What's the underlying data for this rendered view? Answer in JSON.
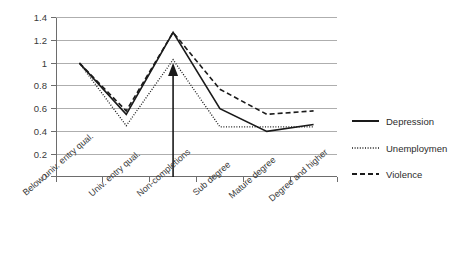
{
  "chart_data": {
    "type": "line",
    "title": "",
    "subtitle": "",
    "xlabel": "",
    "ylabel": "",
    "categories": [
      "Below univ. entry qual.",
      "Univ. entry qual.",
      "Non-completions",
      "Sub degree",
      "Mature degree",
      "Degree and higher"
    ],
    "series": [
      {
        "name": "Depression",
        "style": "solid",
        "color": "#1a1a1a",
        "values": [
          1.0,
          0.55,
          1.27,
          0.6,
          0.4,
          0.46
        ]
      },
      {
        "name": "Unemploymen",
        "style": "dotted",
        "color": "#1a1a1a",
        "values": [
          1.0,
          0.45,
          1.03,
          0.44,
          0.44,
          0.44
        ]
      },
      {
        "name": "Violence",
        "style": "dashed",
        "color": "#1a1a1a",
        "values": [
          1.0,
          0.58,
          1.27,
          0.77,
          0.55,
          0.58
        ]
      }
    ],
    "ylim": [
      0,
      1.4
    ],
    "ytick_labels": [
      "0",
      "0.2",
      "0.4",
      "0.6",
      "0.8",
      "1",
      "1.2",
      "1.4"
    ],
    "ytick_values": [
      0,
      0.2,
      0.4,
      0.6,
      0.8,
      1.0,
      1.2,
      1.4
    ],
    "grid": "horizontal",
    "legend_position": "right",
    "annotations": [
      {
        "kind": "arrow",
        "direction": "up",
        "at_category": "Non-completions",
        "from_value": 0,
        "to_value": 1.0,
        "label": ""
      }
    ]
  },
  "axis": {
    "y_tick_0": "0",
    "y_tick_1": "0.2",
    "y_tick_2": "0.4",
    "y_tick_3": "0.6",
    "y_tick_4": "0.8",
    "y_tick_5": "1",
    "y_tick_6": "1.2",
    "y_tick_7": "1.4"
  },
  "categories": {
    "c0": "Below univ. entry qual.",
    "c1": "Univ. entry qual.",
    "c2": "Non-completions",
    "c3": "Sub degree",
    "c4": "Mature degree",
    "c5": "Degree and higher"
  },
  "legend": {
    "item0": "Depression",
    "item1": "Unemploymen",
    "item2": "Violence"
  }
}
